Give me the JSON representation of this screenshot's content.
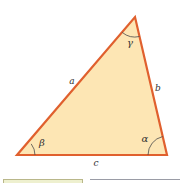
{
  "figure": {
    "type": "triangle",
    "colors": {
      "fill": "#fde6b4",
      "stroke": "#e0602e",
      "arc": "#4a4a4a",
      "text": "#333333"
    },
    "vertices": {
      "bottom_left": [
        17,
        155
      ],
      "bottom_right": [
        167,
        155
      ],
      "top": [
        135,
        17
      ]
    },
    "sides": {
      "a": "a",
      "b": "b",
      "c": "c"
    },
    "angles": {
      "alpha": "α",
      "beta": "β",
      "gamma": "γ"
    }
  },
  "footer": {
    "left_box_color": "#eef0cf",
    "right_line_color": "#9a9ca6"
  }
}
